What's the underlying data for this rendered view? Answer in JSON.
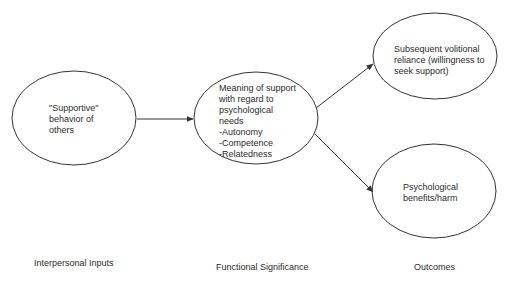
{
  "nodes": [
    {
      "id": "supportive-behavior",
      "lines": [
        "\"Supportive\"",
        "behavior of",
        "others"
      ]
    },
    {
      "id": "meaning-of-support",
      "lines": [
        "Meaning of support",
        "with regard to",
        "psychological",
        "needs",
        "-Autonomy",
        "-Competence",
        "-Relatedness"
      ]
    },
    {
      "id": "volitional-reliance",
      "lines": [
        "Subsequent volitional",
        "reliance (willingness to",
        "seek support)"
      ]
    },
    {
      "id": "psychological-benefits",
      "lines": [
        "Psychological",
        "benefits/harm"
      ]
    }
  ],
  "edges": [
    {
      "from": "supportive-behavior",
      "to": "meaning-of-support"
    },
    {
      "from": "meaning-of-support",
      "to": "volitional-reliance"
    },
    {
      "from": "meaning-of-support",
      "to": "psychological-benefits"
    }
  ],
  "stage_labels": {
    "inputs": "Interpersonal Inputs",
    "significance": "Functional Significance",
    "outcomes": "Outcomes"
  },
  "colors": {
    "stroke": "#333333",
    "background": "#ffffff",
    "text": "#2a2a2a"
  }
}
